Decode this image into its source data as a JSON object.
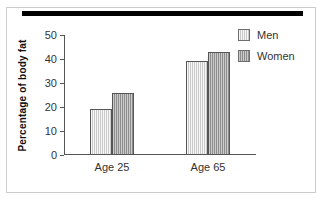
{
  "chart_data": {
    "type": "bar",
    "title": "",
    "subtitle": "",
    "xlabel": "",
    "ylabel": "Percentage of body fat",
    "categories": [
      "Age 25",
      "Age 65"
    ],
    "series": [
      {
        "name": "Men",
        "values": [
          19,
          39
        ],
        "color": "#dedede"
      },
      {
        "name": "Women",
        "values": [
          26,
          43
        ],
        "color": "#a8a8a8"
      }
    ],
    "ylim": [
      0,
      50
    ],
    "yticks": [
      0,
      10,
      20,
      30,
      40,
      50
    ],
    "ytick_labels": [
      "0",
      "10",
      "20",
      "30",
      "40",
      "50"
    ],
    "grid": false,
    "legend_position": "right",
    "annotations": []
  },
  "legend": {
    "items": [
      {
        "label": "Men",
        "swatch": "men-swatch"
      },
      {
        "label": "Women",
        "swatch": "women-swatch"
      }
    ]
  },
  "decoration": {
    "top_rule": "black-horizontal-rule",
    "frame": "thin-gray-border"
  }
}
